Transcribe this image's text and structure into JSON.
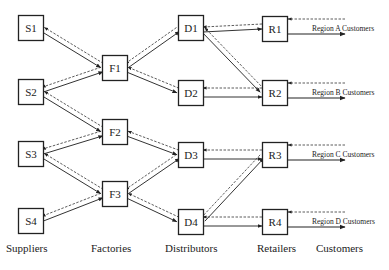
{
  "diagram": {
    "nodes": [
      {
        "id": "S1",
        "label": "S1",
        "x": 18,
        "y": 15
      },
      {
        "id": "S2",
        "label": "S2",
        "x": 18,
        "y": 79
      },
      {
        "id": "S3",
        "label": "S3",
        "x": 18,
        "y": 141
      },
      {
        "id": "S4",
        "label": "S4",
        "x": 18,
        "y": 208
      },
      {
        "id": "F1",
        "label": "F1",
        "x": 102,
        "y": 55
      },
      {
        "id": "F2",
        "label": "F2",
        "x": 102,
        "y": 119
      },
      {
        "id": "F3",
        "label": "F3",
        "x": 102,
        "y": 181
      },
      {
        "id": "D1",
        "label": "D1",
        "x": 178,
        "y": 15
      },
      {
        "id": "D2",
        "label": "D2",
        "x": 178,
        "y": 80
      },
      {
        "id": "D3",
        "label": "D3",
        "x": 178,
        "y": 142
      },
      {
        "id": "D4",
        "label": "D4",
        "x": 178,
        "y": 209
      },
      {
        "id": "R1",
        "label": "R1",
        "x": 262,
        "y": 16
      },
      {
        "id": "R2",
        "label": "R2",
        "x": 262,
        "y": 80
      },
      {
        "id": "R3",
        "label": "R3",
        "x": 262,
        "y": 142
      },
      {
        "id": "R4",
        "label": "R4",
        "x": 262,
        "y": 209
      }
    ],
    "links": [
      {
        "from": "S1",
        "to": "F1"
      },
      {
        "from": "S2",
        "to": "F1"
      },
      {
        "from": "S2",
        "to": "F2"
      },
      {
        "from": "S3",
        "to": "F2"
      },
      {
        "from": "S3",
        "to": "F3"
      },
      {
        "from": "S4",
        "to": "F3"
      },
      {
        "from": "F1",
        "to": "D1"
      },
      {
        "from": "F1",
        "to": "D2"
      },
      {
        "from": "F2",
        "to": "D3"
      },
      {
        "from": "F3",
        "to": "D3"
      },
      {
        "from": "F3",
        "to": "D4"
      },
      {
        "from": "D1",
        "to": "R1"
      },
      {
        "from": "D1",
        "to": "R2"
      },
      {
        "from": "D2",
        "to": "R2"
      },
      {
        "from": "D3",
        "to": "R3"
      },
      {
        "from": "D4",
        "to": "R3"
      },
      {
        "from": "D4",
        "to": "R4"
      }
    ],
    "legend_note": "solid = material flow (forward), dashed = information flow (backward)",
    "regions": [
      {
        "retailer": "R1",
        "label": "Region A Customers"
      },
      {
        "retailer": "R2",
        "label": "Region B Customers"
      },
      {
        "retailer": "R3",
        "label": "Region C Customers"
      },
      {
        "retailer": "R4",
        "label": "Region D Customers"
      }
    ],
    "columns": [
      {
        "label": "Suppliers",
        "x": 6
      },
      {
        "label": "Factories",
        "x": 91
      },
      {
        "label": "Distributors",
        "x": 165
      },
      {
        "label": "Retailers",
        "x": 257
      },
      {
        "label": "Customers",
        "x": 316
      }
    ]
  }
}
